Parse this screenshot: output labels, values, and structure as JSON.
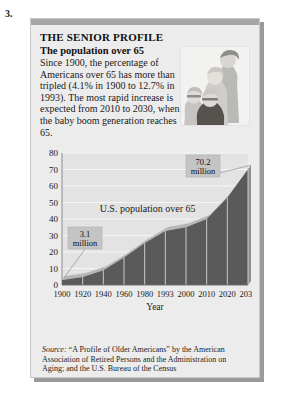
{
  "item_number": "3.",
  "panel": {
    "headline": "THE SENIOR PROFILE",
    "subhead": "The population over 65",
    "blurb": "Since 1900, the percentage of Americans over 65 has more than tripled (4.1% in 1900 to 12.7% in 1993). The most rapid increase is expected from 2010 to 2030, when the baby boom generation reaches 65.",
    "photo_alt": "group-of-seniors-photo"
  },
  "source": {
    "prefix": "Source:",
    "text": " “A Profile of Older Americans” by the American Association of Retired Persons and the Administration on Aging; and the U.S. Bureau of the Census"
  },
  "annotations": {
    "start_callout": {
      "value": "3.1",
      "unit": "million"
    },
    "end_callout": {
      "value": "70.2",
      "unit": "million"
    },
    "series_label": "U.S. population over 65"
  },
  "colors": {
    "area_fill": "#5a5a5a",
    "area_top": "#b6b6b6",
    "panel_bg": "#ececec",
    "plot_bg": "#e3e3e3",
    "top_bar": "#a6a6a6",
    "callout_bg": "#c4c4c4",
    "text": "#1a1a1a"
  },
  "chart_data": {
    "type": "area",
    "title": "U.S. population over 65",
    "xlabel": "Year",
    "ylabel": "",
    "categories": [
      "1900",
      "1920",
      "1940",
      "1960",
      "1980",
      "1993",
      "2000",
      "2010",
      "2020",
      "2030"
    ],
    "values": [
      3.1,
      4.9,
      9.0,
      16.7,
      25.5,
      32.8,
      35.0,
      40.0,
      53.0,
      70.2
    ],
    "yticks": [
      0,
      10,
      20,
      30,
      40,
      50,
      60,
      70,
      80
    ],
    "ylim": [
      0,
      80
    ],
    "units": "millions",
    "grid": true,
    "legend": "none",
    "annotations": [
      {
        "category": "1900",
        "value": 3.1,
        "label": "3.1 million"
      },
      {
        "category": "2030",
        "value": 70.2,
        "label": "70.2 million"
      }
    ]
  }
}
